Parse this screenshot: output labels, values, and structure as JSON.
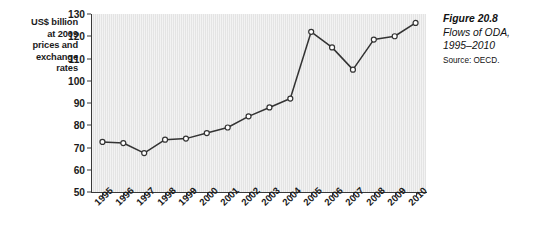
{
  "figure": {
    "caption_title": "Figure 20.8",
    "caption_line1": "Flows of ODA,",
    "caption_line2": "1995–2010",
    "source": "Source: OECD."
  },
  "axis": {
    "y_title": "US$ billion at 2009 prices and exchange rates",
    "y_title_lines": [
      "US$ billion",
      "at 2009",
      "prices and",
      "exchange",
      "rates"
    ]
  },
  "colors": {
    "plot_background": "#e4e4e4",
    "line": "#333333",
    "marker_fill": "#ffffff",
    "marker_stroke": "#333333",
    "axis": "#3a3a3a",
    "text": "#1a1a1a"
  },
  "chart_data": {
    "type": "line",
    "title": "Flows of ODA, 1995–2010",
    "xlabel": "",
    "ylabel": "US$ billion at 2009 prices and exchange rates",
    "ylim": [
      50,
      130
    ],
    "yticks": [
      50,
      60,
      70,
      80,
      90,
      100,
      110,
      120,
      130
    ],
    "grid": false,
    "legend": null,
    "categories": [
      "1995",
      "1996",
      "1997",
      "1998",
      "1999",
      "2000",
      "2001",
      "2002",
      "2003",
      "2004",
      "2005",
      "2006",
      "2007",
      "2008",
      "2009",
      "2010"
    ],
    "series": [
      {
        "name": "Flows of ODA",
        "values": [
          72.5,
          72,
          67.5,
          73.5,
          74,
          76.5,
          79,
          84,
          88,
          92,
          122,
          115,
          105,
          118.5,
          120,
          126
        ]
      }
    ]
  }
}
